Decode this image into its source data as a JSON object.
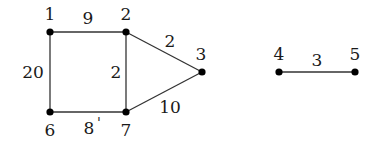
{
  "diagram": {
    "type": "weighted-undirected-graph",
    "components": 2,
    "nodes": [
      {
        "id": "1",
        "label": "1",
        "x": 50,
        "y": 32,
        "label_x": 50,
        "label_y": 20
      },
      {
        "id": "2",
        "label": "2",
        "x": 126,
        "y": 32,
        "label_x": 126,
        "label_y": 20
      },
      {
        "id": "3",
        "label": "3",
        "x": 202,
        "y": 72,
        "label_x": 201,
        "label_y": 60
      },
      {
        "id": "4",
        "label": "4",
        "x": 279,
        "y": 72,
        "label_x": 279,
        "label_y": 60
      },
      {
        "id": "5",
        "label": "5",
        "x": 355,
        "y": 72,
        "label_x": 355,
        "label_y": 60
      },
      {
        "id": "6",
        "label": "6",
        "x": 50,
        "y": 112,
        "label_x": 50,
        "label_y": 136
      },
      {
        "id": "7",
        "label": "7",
        "x": 126,
        "y": 112,
        "label_x": 126,
        "label_y": 136
      }
    ],
    "edges": [
      {
        "from": "1",
        "to": "2",
        "weight": "9",
        "label_x": 88,
        "label_y": 24
      },
      {
        "from": "2",
        "to": "3",
        "weight": "2",
        "label_x": 170,
        "label_y": 47
      },
      {
        "from": "2",
        "to": "7",
        "weight": "2",
        "label_x": 116,
        "label_y": 78
      },
      {
        "from": "1",
        "to": "6",
        "weight": "20",
        "label_x": 33,
        "label_y": 78
      },
      {
        "from": "6",
        "to": "7",
        "weight": "8",
        "label_x": 89,
        "label_y": 134,
        "mark": "'"
      },
      {
        "from": "7",
        "to": "3",
        "weight": "10",
        "label_x": 170,
        "label_y": 113
      },
      {
        "from": "4",
        "to": "5",
        "weight": "3",
        "label_x": 317,
        "label_y": 66
      }
    ]
  }
}
